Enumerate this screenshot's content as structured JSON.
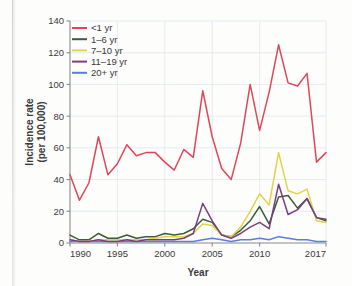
{
  "chart_data": {
    "type": "line",
    "title": "",
    "xlabel": "Year",
    "ylabel": "Incidence rate\n(per 100,000)",
    "ylabel_line1": "Incidence rate",
    "ylabel_line2": "(per 100,000)",
    "xlim": [
      1990,
      2017
    ],
    "ylim": [
      0,
      140
    ],
    "ytick_values": [
      0,
      20,
      40,
      60,
      80,
      100,
      120,
      140
    ],
    "ytick_labels": [
      "0",
      "20",
      "40",
      "60",
      "80",
      "100",
      "120",
      "140"
    ],
    "xtick_values": [
      1990,
      1995,
      2000,
      2005,
      2010,
      2017
    ],
    "xtick_labels": [
      "1990",
      "1995",
      "2000",
      "2005",
      "2010",
      "2017"
    ],
    "grid": true,
    "legend_position": "top-left",
    "x": [
      1990,
      1991,
      1992,
      1993,
      1994,
      1995,
      1996,
      1997,
      1998,
      1999,
      2000,
      2001,
      2002,
      2003,
      2004,
      2005,
      2006,
      2007,
      2008,
      2009,
      2010,
      2011,
      2012,
      2013,
      2014,
      2015,
      2016,
      2017
    ],
    "series": [
      {
        "name": "<1 yr",
        "color": "#e0465a",
        "values": [
          43,
          27,
          38,
          67,
          43,
          50,
          62,
          55,
          57,
          57,
          51,
          46,
          59,
          54,
          96,
          67,
          47,
          40,
          63,
          100,
          71,
          95,
          125,
          101,
          99,
          107,
          51,
          57
        ]
      },
      {
        "name": "1–6 yr",
        "color": "#3d5c3a",
        "values": [
          5,
          2,
          2,
          6,
          3,
          3,
          5,
          3,
          4,
          4,
          6,
          5,
          6,
          9,
          15,
          13,
          5,
          4,
          8,
          14,
          23,
          12,
          29,
          30,
          22,
          28,
          16,
          14
        ]
      },
      {
        "name": "7–10 yr",
        "color": "#e3d24a",
        "values": [
          2,
          1,
          1,
          2,
          2,
          2,
          2,
          2,
          2,
          3,
          4,
          4,
          4,
          6,
          12,
          11,
          5,
          4,
          10,
          20,
          31,
          24,
          57,
          33,
          31,
          34,
          14,
          13
        ]
      },
      {
        "name": "11–19 yr",
        "color": "#7a3f7e",
        "values": [
          2,
          1,
          1,
          2,
          1,
          1,
          2,
          1,
          2,
          2,
          2,
          2,
          3,
          6,
          25,
          14,
          5,
          3,
          6,
          10,
          13,
          9,
          37,
          18,
          21,
          28,
          16,
          15
        ]
      },
      {
        "name": "20+ yr",
        "color": "#5a7fd6",
        "values": [
          1,
          1,
          1,
          1,
          1,
          1,
          1,
          1,
          1,
          1,
          1,
          1,
          1,
          1,
          2,
          3,
          2,
          1,
          2,
          2,
          3,
          2,
          4,
          3,
          2,
          2,
          1,
          1
        ]
      }
    ]
  }
}
